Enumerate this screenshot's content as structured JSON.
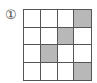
{
  "label": "①",
  "grid": {
    "rows": 4,
    "cols": 4,
    "shaded_cells": [
      [
        0,
        3
      ],
      [
        1,
        2
      ],
      [
        2,
        1
      ],
      [
        3,
        3
      ]
    ],
    "shade_color": "#b8b8b8"
  }
}
